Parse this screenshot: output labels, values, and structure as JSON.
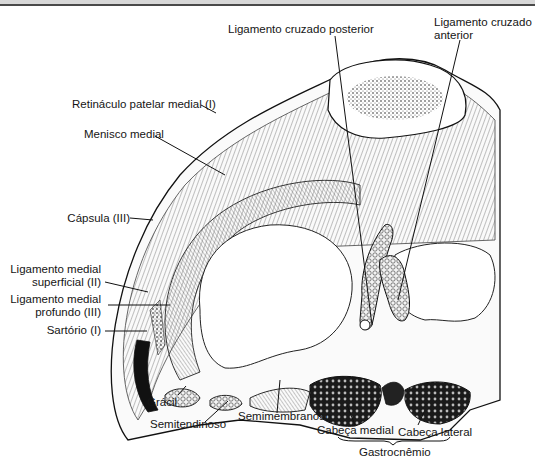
{
  "figure": {
    "labels": {
      "lcp": "Ligamento cruzado posterior",
      "lca_1": "Ligamento cruzado",
      "lca_2": "anterior",
      "retinaculo": "Retináculo patelar medial (I)",
      "menisco": "Menisco medial",
      "capsula": "Cápsula (III)",
      "lms_1": "Ligamento medial",
      "lms_2": "superficial (II)",
      "lmp_1": "Ligamento medial",
      "lmp_2": "profundo (III)",
      "sartorio": "Sartório (I)",
      "gracil": "Grácil",
      "semitendinoso": "Semitendinoso",
      "semimembranoso": "Semimembranoso",
      "cabeca_medial": "Cabeça medial",
      "cabeca_lateral": "Cabeça lateral",
      "gastrocnemio": "Gastrocnêmio"
    }
  }
}
